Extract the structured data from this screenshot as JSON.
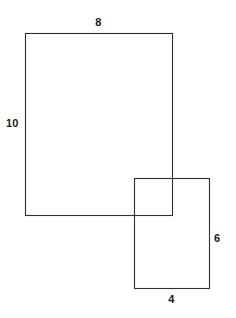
{
  "figure": {
    "background_color": "#ffffff",
    "stroke_color": "#2e2e2e",
    "label_color": "#1a1a1a",
    "canvas": {
      "width": 236,
      "height": 318
    }
  },
  "shapes": {
    "large_rectangle": {
      "name": "large-rectangle",
      "x": 25,
      "y": 33,
      "width": 147,
      "height": 182,
      "top_label": "8",
      "left_label": "10"
    },
    "small_rectangle": {
      "name": "small-rectangle",
      "x": 134,
      "y": 178,
      "width": 75,
      "height": 110,
      "bottom_label": "4",
      "right_label": "6"
    }
  },
  "labels": {
    "large_top": "8",
    "large_left": "10",
    "small_bottom": "4",
    "small_right": "6"
  },
  "chart_data": {
    "type": "diagram",
    "shapes": [
      {
        "shape": "rectangle",
        "id": "large",
        "labeled_sides": {
          "top": 8,
          "left": 10
        },
        "pixel_box": {
          "x": 25,
          "y": 33,
          "width": 147,
          "height": 182
        }
      },
      {
        "shape": "rectangle",
        "id": "small",
        "labeled_sides": {
          "bottom": 4,
          "right": 6
        },
        "pixel_box": {
          "x": 134,
          "y": 178,
          "width": 75,
          "height": 110
        }
      }
    ],
    "annotations": [
      "8",
      "10",
      "4",
      "6"
    ]
  }
}
